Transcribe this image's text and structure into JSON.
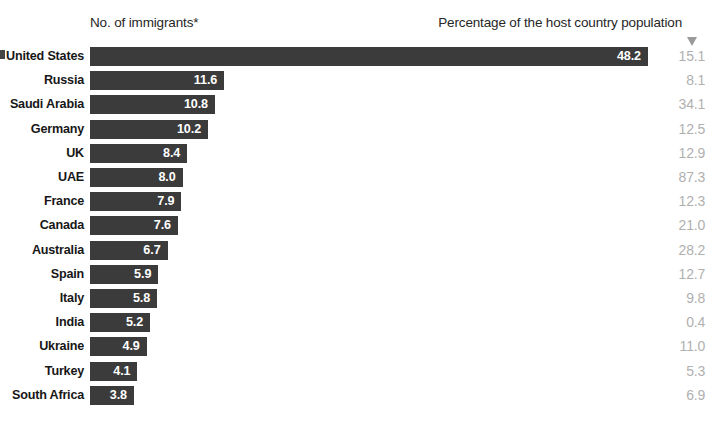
{
  "header": {
    "left_label": "No. of immigrants*",
    "right_label": "Percentage of the host country population",
    "arrow_icon": "arrow-down-icon"
  },
  "colors": {
    "bar": "#3b3b3b",
    "bar_value_text": "#ffffff",
    "category_text": "#171717",
    "percent_text": "#b0b0b0",
    "background": "#ffffff"
  },
  "chart_data": {
    "type": "bar",
    "orientation": "horizontal",
    "title": "",
    "xlabel": "No. of immigrants*",
    "ylabel": "",
    "grid": false,
    "legend": "none",
    "xlim": [
      0,
      48.2
    ],
    "categories": [
      "United States",
      "Russia",
      "Saudi Arabia",
      "Germany",
      "UK",
      "UAE",
      "France",
      "Canada",
      "Australia",
      "Spain",
      "Italy",
      "India",
      "Ukraine",
      "Turkey",
      "South Africa"
    ],
    "values": [
      48.2,
      11.6,
      10.8,
      10.2,
      8.4,
      8.0,
      7.9,
      7.6,
      6.7,
      5.9,
      5.8,
      5.2,
      4.9,
      4.1,
      3.8
    ],
    "value_labels": [
      "48.2",
      "11.6",
      "10.8",
      "10.2",
      "8.4",
      "8.0",
      "7.9",
      "7.6",
      "6.7",
      "5.9",
      "5.8",
      "5.2",
      "4.9",
      "4.1",
      "3.8"
    ],
    "series": [
      {
        "name": "No. of immigrants*",
        "values": [
          48.2,
          11.6,
          10.8,
          10.2,
          8.4,
          8.0,
          7.9,
          7.6,
          6.7,
          5.9,
          5.8,
          5.2,
          4.9,
          4.1,
          3.8
        ]
      },
      {
        "name": "Percentage of the host country population",
        "values": [
          15.1,
          8.1,
          34.1,
          12.5,
          12.9,
          87.3,
          12.3,
          21.0,
          28.2,
          12.7,
          9.8,
          0.4,
          11.0,
          5.3,
          6.9
        ]
      }
    ],
    "percent_labels": [
      "15.1",
      "8.1",
      "34.1",
      "12.5",
      "12.9",
      "87.3",
      "12.3",
      "21.0",
      "28.2",
      "12.7",
      "9.8",
      "0.4",
      "11.0",
      "5.3",
      "6.9"
    ]
  }
}
